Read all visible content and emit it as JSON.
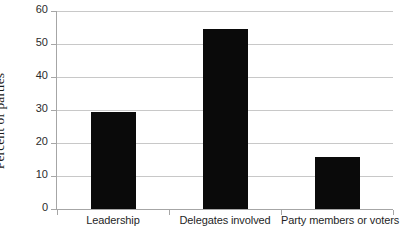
{
  "chart_data": {
    "type": "bar",
    "title": "",
    "subtitle": "",
    "xlabel": "",
    "ylabel": "Percent of parties",
    "categories": [
      "Leadership",
      "Delegates involved",
      "Party members or voters"
    ],
    "values": [
      29.5,
      54.7,
      15.7
    ],
    "ylim": [
      0,
      60
    ],
    "ytick_step": 10,
    "ytick_labels": [
      "0",
      "10",
      "20",
      "30",
      "40",
      "50",
      "60"
    ],
    "ytick_values": [
      0,
      10,
      20,
      30,
      40,
      50,
      60
    ],
    "grid": "horizontal",
    "legend": "none",
    "annotations": [],
    "colors": {
      "bar": "#0a0a0a",
      "gridline": "#c8c8c8",
      "axis": "#a6a6a6",
      "background": "#ffffff",
      "text": "#1f1f1f"
    }
  }
}
